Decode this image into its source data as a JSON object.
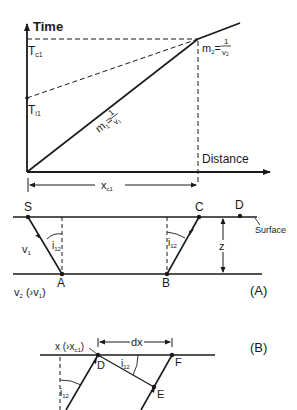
{
  "graph": {
    "y_axis_label": "Time",
    "x_axis_label": "Distance",
    "tc1": {
      "main": "T",
      "sub": "c1"
    },
    "ti1": {
      "main": "T",
      "sub": "i1"
    },
    "m1": {
      "lhs": "m",
      "lhs_sub": "1",
      "eq": "=",
      "num": "1",
      "den": "v",
      "den_sub": "1"
    },
    "m2": {
      "lhs": "m",
      "lhs_sub": "2",
      "eq": "=",
      "num": "1",
      "den": "v",
      "den_sub": "2"
    },
    "xc1": {
      "main": "x",
      "sub": "c1"
    }
  },
  "panel_a": {
    "label": "(A)",
    "points": {
      "S": "S",
      "A": "A",
      "B": "B",
      "C": "C",
      "D": "D"
    },
    "surface_label": "Surface",
    "v1": {
      "main": "v",
      "sub": "1"
    },
    "v2": {
      "main": "v",
      "sub": "2",
      "rest": " (›v",
      "rest_sub": "1",
      "close": ")"
    },
    "angle_left": {
      "main": "i",
      "sub": "12"
    },
    "angle_right": {
      "main": "i",
      "sub": "12"
    },
    "depth": "z"
  },
  "panel_b": {
    "label": "(B)",
    "points": {
      "D": "D",
      "E": "E",
      "F": "F"
    },
    "x_label": {
      "main": "x (›x",
      "sub": "c1",
      "close": ")"
    },
    "dx": "dx",
    "angle_top": {
      "main": "i",
      "sub": "12"
    },
    "angle_left": {
      "main": "i",
      "sub": "12"
    }
  }
}
